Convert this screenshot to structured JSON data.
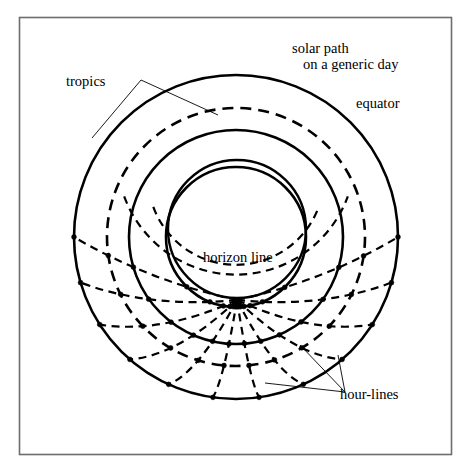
{
  "figure": {
    "background_color": "#ffffff",
    "line_color": "#000000",
    "frame_color": "#6d6d6d",
    "frame": {
      "x": 19,
      "y": 17,
      "width": 433,
      "height": 438
    }
  },
  "labels": {
    "tropics": "tropics",
    "solar_path_line1": "solar path",
    "solar_path_line2": "on a generic day",
    "equator": "equator",
    "horizon_line": "horizon line",
    "hour_lines": "hour-lines"
  },
  "chart_data": {
    "type": "diagram",
    "center": {
      "x": 236,
      "y": 237
    },
    "circles": [
      {
        "name": "tropic-of-capricorn",
        "label": "tropics",
        "style": "solid",
        "cx": 236,
        "cy": 237,
        "r": 162
      },
      {
        "name": "solar-path-generic-day",
        "label": "solar path on a generic day",
        "style": "dashed",
        "cx": 236,
        "cy": 237,
        "r": 129
      },
      {
        "name": "equator",
        "label": "equator",
        "style": "solid",
        "cx": 236,
        "cy": 237,
        "r": 107
      },
      {
        "name": "tropic-of-cancer",
        "label": "tropics",
        "style": "solid",
        "cx": 236,
        "cy": 237,
        "r": 70
      },
      {
        "name": "horizon-line",
        "label": "horizon line",
        "style": "solid",
        "cx": 237,
        "cy": 229,
        "r": 69
      }
    ],
    "hour_lines": {
      "count": 11,
      "style": "dashed",
      "description": "Dashed arcs converging at the zenith point below the horizon circle, marked with dots where they cross the tropics, equator and solar path",
      "zenith": {
        "x": 237,
        "y": 300
      },
      "angles_deg": [
        0,
        15,
        30,
        45,
        60,
        75,
        90,
        105,
        120,
        135,
        150,
        165,
        180
      ]
    },
    "node_dots": {
      "radius": 2.4,
      "description": "Intersection markers between hour-lines and the concentric circles"
    }
  },
  "leaders": {
    "tropics": [
      [
        [
          141,
          80
        ],
        [
          218,
          115
        ]
      ],
      [
        [
          141,
          80
        ],
        [
          92,
          138
        ]
      ]
    ],
    "solar_path": [
      [
        290,
        56
      ],
      [
        270,
        108
      ]
    ],
    "equator": [
      [
        350,
        102
      ],
      [
        310,
        152
      ]
    ],
    "hour_lines": [
      [
        [
          345,
          392
        ],
        [
          300,
          345
        ]
      ],
      [
        [
          345,
          392
        ],
        [
          265,
          383
        ]
      ],
      [
        [
          345,
          392
        ],
        [
          338,
          355
        ]
      ]
    ]
  }
}
